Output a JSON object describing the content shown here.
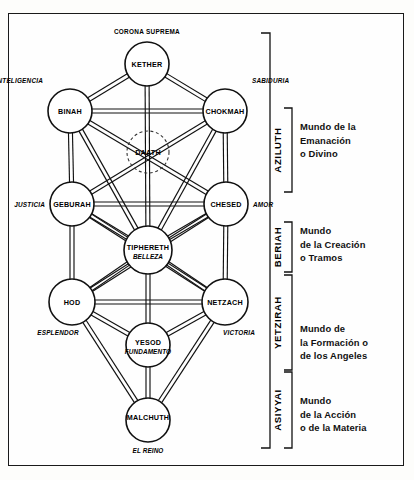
{
  "diagram": {
    "type": "kabbalistic-tree-of-life",
    "colors": {
      "ink": "#111111",
      "paper": "#fefefe",
      "border": "#1a1a1a"
    },
    "top_label": "CORONA SUPREMA",
    "sephirot": [
      {
        "id": "kether",
        "name": "KETHER",
        "sub": "",
        "side_label": "",
        "side": "none",
        "cx": 147,
        "cy": 64,
        "r": 22,
        "dashed": false
      },
      {
        "id": "binah",
        "name": "BINAH",
        "sub": "",
        "side_label": "INTELIGENCIA",
        "side": "left",
        "cx": 70,
        "cy": 111,
        "r": 22,
        "dashed": false
      },
      {
        "id": "chokmah",
        "name": "CHOKMAH",
        "sub": "",
        "side_label": "SABIDURIA",
        "side": "right",
        "cx": 225,
        "cy": 111,
        "r": 22,
        "dashed": false
      },
      {
        "id": "daath",
        "name": "DAATH",
        "sub": "",
        "side_label": "",
        "side": "none",
        "cx": 148,
        "cy": 152,
        "r": 21,
        "dashed": true
      },
      {
        "id": "geburah",
        "name": "GEBURAH",
        "sub": "",
        "side_label": "JUSTICIA",
        "side": "left",
        "cx": 72,
        "cy": 204,
        "r": 22,
        "dashed": false
      },
      {
        "id": "chesed",
        "name": "CHESED",
        "sub": "",
        "side_label": "AMOR",
        "side": "right",
        "cx": 226,
        "cy": 204,
        "r": 22,
        "dashed": false
      },
      {
        "id": "tiphereth",
        "name": "TIPHERETH",
        "sub": "BELLEZA",
        "side_label": "",
        "side": "none",
        "cx": 148,
        "cy": 250,
        "r": 24,
        "dashed": false
      },
      {
        "id": "hod",
        "name": "HOD",
        "sub": "",
        "side_label": "ESPLENDOR",
        "side": "left",
        "cx": 72,
        "cy": 302,
        "r": 23,
        "dashed": false
      },
      {
        "id": "netzach",
        "name": "NETZACH",
        "sub": "",
        "side_label": "VICTORIA",
        "side": "right",
        "cx": 225,
        "cy": 302,
        "r": 23,
        "dashed": false
      },
      {
        "id": "yesod",
        "name": "YESOD",
        "sub": "FUNDAMENTO",
        "side_label": "",
        "side": "none",
        "cx": 148,
        "cy": 345,
        "r": 22,
        "dashed": false
      },
      {
        "id": "malchuth",
        "name": "MALCHUTH",
        "sub": "EL REINO",
        "side_label": "",
        "side": "none",
        "cx": 148,
        "cy": 420,
        "r": 22,
        "dashed": false
      }
    ],
    "paths": [
      [
        "kether",
        "binah"
      ],
      [
        "kether",
        "chokmah"
      ],
      [
        "kether",
        "tiphereth"
      ],
      [
        "binah",
        "chokmah"
      ],
      [
        "binah",
        "geburah"
      ],
      [
        "binah",
        "tiphereth"
      ],
      [
        "binah",
        "chesed"
      ],
      [
        "chokmah",
        "chesed"
      ],
      [
        "chokmah",
        "tiphereth"
      ],
      [
        "chokmah",
        "geburah"
      ],
      [
        "geburah",
        "chesed"
      ],
      [
        "geburah",
        "tiphereth"
      ],
      [
        "geburah",
        "hod"
      ],
      [
        "geburah",
        "netzach"
      ],
      [
        "chesed",
        "tiphereth"
      ],
      [
        "chesed",
        "netzach"
      ],
      [
        "chesed",
        "hod"
      ],
      [
        "tiphereth",
        "hod"
      ],
      [
        "tiphereth",
        "netzach"
      ],
      [
        "tiphereth",
        "yesod"
      ],
      [
        "hod",
        "netzach"
      ],
      [
        "hod",
        "yesod"
      ],
      [
        "hod",
        "malchuth"
      ],
      [
        "netzach",
        "yesod"
      ],
      [
        "netzach",
        "malchuth"
      ],
      [
        "yesod",
        "malchuth"
      ]
    ],
    "worlds": [
      {
        "id": "aziluth",
        "name": "AZILUTH",
        "description": [
          "Mundo de la",
          "Emanación",
          "o Divino"
        ],
        "bracket_top": 108,
        "bracket_bottom": 192,
        "text_y": 130
      },
      {
        "id": "beriah",
        "name": "BERIAH",
        "description": [
          "Mundo",
          "de la Creación",
          "o Tramos"
        ],
        "bracket_top": 222,
        "bracket_bottom": 272,
        "text_y": 234
      },
      {
        "id": "yetzirah",
        "name": "YETZIRAH",
        "description": [
          "Mundo de",
          "la Formación o",
          "de los Angeles"
        ],
        "bracket_top": 275,
        "bracket_bottom": 370,
        "text_y": 332
      },
      {
        "id": "asiyyai",
        "name": "ASIYYAI",
        "description": [
          "Mundo",
          "de la Acción",
          "o de la Materia"
        ],
        "bracket_top": 372,
        "bracket_bottom": 448,
        "text_y": 404
      }
    ],
    "outer_bracket": {
      "top": 33,
      "bottom": 448,
      "x": 270
    }
  }
}
